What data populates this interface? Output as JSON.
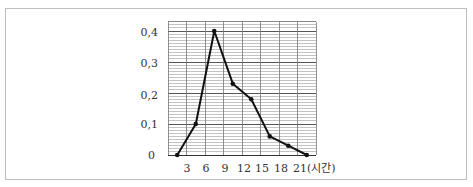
{
  "chart_data": {
    "type": "line",
    "title": "",
    "xlabel": "(시간)",
    "ylabel": "",
    "x_tick_labels": [
      "3",
      "6",
      "9",
      "12",
      "15",
      "18",
      "21(시간)"
    ],
    "x_ticks": [
      3,
      6,
      9,
      12,
      15,
      18,
      21
    ],
    "y_tick_labels": [
      "0",
      "0.1",
      "0.2",
      "0.3",
      "0.4"
    ],
    "y_ticks": [
      0,
      0.1,
      0.2,
      0.3,
      0.4
    ],
    "xlim": [
      0,
      24
    ],
    "ylim": [
      0,
      0.43
    ],
    "grid": true,
    "legend": null,
    "series": [
      {
        "name": "relative frequency",
        "x": [
          1.5,
          4.5,
          7.5,
          10.5,
          13.5,
          16.5,
          19.5,
          22.5
        ],
        "values": [
          0,
          0.1,
          0.4,
          0.23,
          0.18,
          0.06,
          0.03,
          0
        ]
      }
    ]
  },
  "axis": {
    "origin_label": "0",
    "y_labels": [
      "0,1",
      "0,2",
      "0,3",
      "0,4"
    ],
    "x_labels": [
      "3",
      "6",
      "9",
      "12",
      "15",
      "18",
      "21(시간)"
    ]
  }
}
